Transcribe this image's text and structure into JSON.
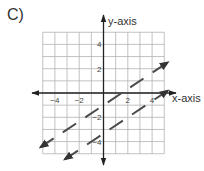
{
  "figure_label": "C)",
  "chart_data": {
    "type": "line",
    "title": "",
    "xlabel": "x-axis",
    "ylabel": "y-axis",
    "xlim": [
      -5,
      5
    ],
    "ylim": [
      -5,
      5
    ],
    "grid": true,
    "x_ticks": [
      -4,
      -2,
      2,
      4
    ],
    "y_ticks": [
      4,
      2,
      -2,
      -4
    ],
    "x_tick_labels": [
      "−4",
      "−2",
      "2",
      "4"
    ],
    "y_tick_labels": [
      "4",
      "2",
      "−2",
      "−4"
    ],
    "series": [
      {
        "name": "line-a",
        "style": "dashed",
        "arrows": "both",
        "slope": 0.6667,
        "intercept": -1,
        "x": [
          -5.2,
          5.3
        ],
        "y": [
          -4.47,
          2.53
        ]
      },
      {
        "name": "line-b",
        "style": "dashed",
        "arrows": "both",
        "slope": 0.6667,
        "intercept": -3.33,
        "x": [
          -3.2,
          5.3
        ],
        "y": [
          -5.47,
          0.2
        ]
      }
    ],
    "legend": null
  },
  "colors": {
    "grid": "#b3b3b3",
    "axis": "#222222",
    "line": "#4a4a4a"
  }
}
